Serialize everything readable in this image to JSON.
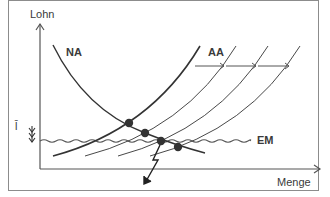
{
  "diagram": {
    "axes": {
      "y_label": "Lohn",
      "x_label": "Menge"
    },
    "curves": {
      "demand_label": "NA",
      "supply_label": "AA",
      "min_wage_label": "EM",
      "wage_marker": "l̄"
    },
    "colors": {
      "line": "#3a3a3a",
      "frame": "#8c8c8c",
      "dot": "#333333"
    }
  }
}
